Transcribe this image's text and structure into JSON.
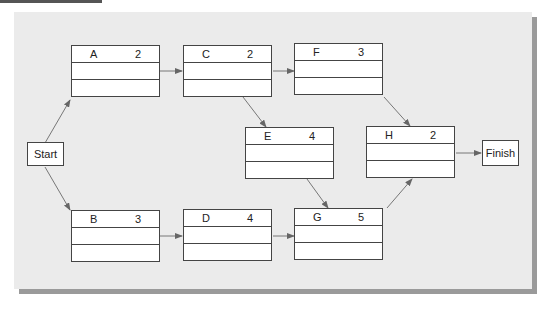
{
  "diagram": {
    "type": "activity-on-node network",
    "start": {
      "label": "Start"
    },
    "finish": {
      "label": "Finish"
    },
    "activities": [
      {
        "id": "A",
        "duration": "2"
      },
      {
        "id": "B",
        "duration": "3"
      },
      {
        "id": "C",
        "duration": "2"
      },
      {
        "id": "D",
        "duration": "4"
      },
      {
        "id": "E",
        "duration": "4"
      },
      {
        "id": "F",
        "duration": "3"
      },
      {
        "id": "G",
        "duration": "5"
      },
      {
        "id": "H",
        "duration": "2"
      }
    ],
    "edges": [
      [
        "Start",
        "A"
      ],
      [
        "Start",
        "B"
      ],
      [
        "A",
        "C"
      ],
      [
        "B",
        "D"
      ],
      [
        "C",
        "F"
      ],
      [
        "C",
        "E"
      ],
      [
        "D",
        "G"
      ],
      [
        "E",
        "G"
      ],
      [
        "F",
        "H"
      ],
      [
        "G",
        "H"
      ],
      [
        "H",
        "Finish"
      ]
    ]
  }
}
